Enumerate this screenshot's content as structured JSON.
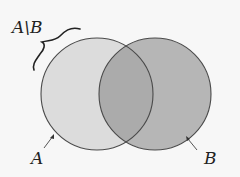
{
  "diagram": {
    "type": "venn",
    "title_label": "A\\B",
    "sets": [
      {
        "name": "A",
        "label": "A",
        "cx": 97,
        "cy": 94,
        "r": 56,
        "fill": "#dcdcdc"
      },
      {
        "name": "B",
        "label": "B",
        "cx": 155,
        "cy": 94,
        "r": 56,
        "fill": "#b6b6b6"
      }
    ],
    "intersection_fill": "#ababab",
    "stroke_color": "#4a4a4a",
    "background": "#f7f7f7",
    "highlight": "A\\B (A minus B) indicated by curly brace"
  }
}
